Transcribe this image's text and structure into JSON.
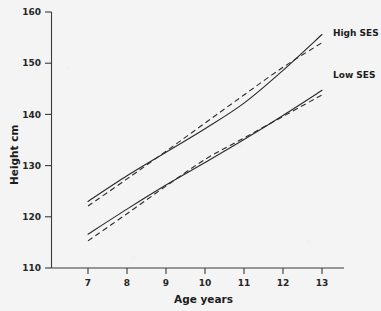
{
  "chart_data": {
    "type": "line",
    "title": "",
    "xlabel": "Age years",
    "ylabel": "Height  cm",
    "xlim": [
      6.5,
      13.5
    ],
    "ylim": [
      110,
      160
    ],
    "xticks": [
      "7",
      "8",
      "9",
      "10",
      "11",
      "12",
      "13"
    ],
    "yticks": [
      "110",
      "120",
      "130",
      "140",
      "150",
      "160"
    ],
    "grid": false,
    "legend_position": "right-inline",
    "x": [
      7,
      8,
      9,
      10,
      11,
      12,
      13
    ],
    "series": [
      {
        "name": "High SES",
        "style": "solid",
        "label": "High SES",
        "values": [
          123.0,
          128.0,
          132.6,
          137.2,
          142.2,
          148.6,
          155.6
        ]
      },
      {
        "name": "High SES (fitted)",
        "style": "dashed",
        "label": "",
        "values": [
          122.1,
          127.4,
          132.8,
          138.3,
          143.8,
          149.2,
          154.0
        ]
      },
      {
        "name": "Low SES",
        "style": "solid",
        "label": "Low SES",
        "values": [
          116.6,
          121.5,
          126.2,
          130.6,
          135.1,
          139.8,
          144.7
        ]
      },
      {
        "name": "Low SES (fitted)",
        "style": "dashed",
        "label": "",
        "values": [
          115.3,
          120.6,
          126.0,
          131.2,
          135.4,
          139.6,
          143.8
        ]
      }
    ],
    "annotations": [
      {
        "text": "High SES",
        "x": 13.3,
        "y": 155.6
      },
      {
        "text": "Low SES",
        "x": 13.3,
        "y": 147.2
      }
    ]
  }
}
